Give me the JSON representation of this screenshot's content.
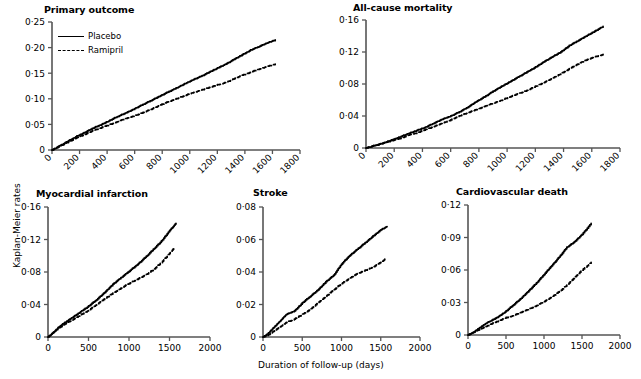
{
  "figure": {
    "y_axis_label": "Kaplan-Meier rates",
    "x_axis_label": "Duration of follow-up (days)",
    "legend": {
      "placebo_label": "Placebo",
      "ramipril_label": "Ramipril"
    },
    "colors": {
      "line": "#000000",
      "axis": "#555555",
      "background": "#ffffff"
    }
  },
  "chart_data": [
    {
      "type": "line",
      "title": "Primary outcome",
      "xlabel": "",
      "ylabel": "Kaplan-Meier rates",
      "xlim": [
        0,
        1800
      ],
      "ylim": [
        0,
        0.25
      ],
      "xticks": [
        "0",
        "200",
        "400",
        "600",
        "800",
        "1000",
        "1200",
        "1400",
        "1600",
        "1800"
      ],
      "yticks": [
        "0",
        "0·05",
        "0·10",
        "0·15",
        "0·20",
        "0·25"
      ],
      "ytick_values": [
        0,
        0.05,
        0.1,
        0.15,
        0.2,
        0.25
      ],
      "grid": false,
      "legend_position": "top-left",
      "series": [
        {
          "name": "Placebo",
          "style": "solid",
          "x": [
            0,
            60,
            120,
            180,
            240,
            300,
            360,
            420,
            480,
            540,
            600,
            660,
            720,
            780,
            840,
            900,
            960,
            1020,
            1080,
            1140,
            1200,
            1260,
            1320,
            1380,
            1440,
            1500,
            1560,
            1620
          ],
          "values": [
            0,
            0.009,
            0.018,
            0.027,
            0.035,
            0.043,
            0.05,
            0.058,
            0.066,
            0.073,
            0.081,
            0.089,
            0.097,
            0.105,
            0.113,
            0.121,
            0.129,
            0.137,
            0.144,
            0.152,
            0.16,
            0.168,
            0.177,
            0.186,
            0.195,
            0.202,
            0.209,
            0.215
          ]
        },
        {
          "name": "Ramipril",
          "style": "dashed",
          "x": [
            0,
            60,
            120,
            180,
            240,
            300,
            360,
            420,
            480,
            540,
            600,
            660,
            720,
            780,
            840,
            900,
            960,
            1020,
            1080,
            1140,
            1200,
            1260,
            1320,
            1380,
            1440,
            1500,
            1560,
            1620
          ],
          "values": [
            0,
            0.008,
            0.016,
            0.024,
            0.031,
            0.038,
            0.044,
            0.05,
            0.056,
            0.062,
            0.067,
            0.073,
            0.08,
            0.087,
            0.094,
            0.1,
            0.106,
            0.112,
            0.117,
            0.122,
            0.127,
            0.132,
            0.139,
            0.146,
            0.152,
            0.158,
            0.163,
            0.168
          ]
        }
      ]
    },
    {
      "type": "line",
      "title": "All-cause mortality",
      "xlabel": "",
      "ylabel": "",
      "xlim": [
        0,
        1800
      ],
      "ylim": [
        0,
        0.16
      ],
      "xticks": [
        "0",
        "200",
        "400",
        "600",
        "800",
        "1000",
        "1200",
        "1400",
        "1600",
        "1800"
      ],
      "yticks": [
        "0",
        "0·04",
        "0·08",
        "0·12",
        "0·16"
      ],
      "ytick_values": [
        0,
        0.04,
        0.08,
        0.12,
        0.16
      ],
      "grid": false,
      "legend_position": "none",
      "series": [
        {
          "name": "Placebo",
          "style": "solid",
          "x": [
            0,
            60,
            120,
            180,
            240,
            300,
            360,
            420,
            480,
            540,
            600,
            660,
            720,
            780,
            840,
            900,
            960,
            1020,
            1080,
            1140,
            1200,
            1260,
            1320,
            1380,
            1440,
            1500,
            1560,
            1620,
            1680
          ],
          "values": [
            0,
            0.003,
            0.006,
            0.01,
            0.014,
            0.018,
            0.022,
            0.026,
            0.031,
            0.036,
            0.04,
            0.045,
            0.051,
            0.058,
            0.064,
            0.071,
            0.077,
            0.083,
            0.089,
            0.095,
            0.101,
            0.108,
            0.114,
            0.12,
            0.128,
            0.134,
            0.14,
            0.146,
            0.152
          ]
        },
        {
          "name": "Ramipril",
          "style": "dashed",
          "x": [
            0,
            60,
            120,
            180,
            240,
            300,
            360,
            420,
            480,
            540,
            600,
            660,
            720,
            780,
            840,
            900,
            960,
            1020,
            1080,
            1140,
            1200,
            1260,
            1320,
            1380,
            1440,
            1500,
            1560,
            1620,
            1680
          ],
          "values": [
            0,
            0.003,
            0.006,
            0.009,
            0.012,
            0.016,
            0.019,
            0.023,
            0.027,
            0.031,
            0.035,
            0.04,
            0.044,
            0.048,
            0.052,
            0.056,
            0.06,
            0.064,
            0.068,
            0.072,
            0.077,
            0.082,
            0.087,
            0.093,
            0.099,
            0.105,
            0.11,
            0.114,
            0.117
          ]
        }
      ]
    },
    {
      "type": "line",
      "title": "Myocardial infarction",
      "xlabel": "",
      "ylabel": "",
      "xlim": [
        0,
        2000
      ],
      "ylim": [
        0,
        0.16
      ],
      "xticks": [
        "0",
        "500",
        "1000",
        "1500",
        "2000"
      ],
      "yticks": [
        "0",
        "0·04",
        "0·08",
        "0·12",
        "0·16"
      ],
      "ytick_values": [
        0,
        0.04,
        0.08,
        0.12,
        0.16
      ],
      "grid": false,
      "legend_position": "none",
      "series": [
        {
          "name": "Placebo",
          "style": "solid",
          "x": [
            0,
            60,
            120,
            180,
            240,
            300,
            400,
            500,
            600,
            700,
            800,
            900,
            1000,
            1100,
            1200,
            1300,
            1400,
            1500,
            1580
          ],
          "values": [
            0,
            0.005,
            0.011,
            0.016,
            0.02,
            0.024,
            0.031,
            0.038,
            0.046,
            0.055,
            0.065,
            0.073,
            0.081,
            0.089,
            0.098,
            0.108,
            0.118,
            0.131,
            0.14
          ]
        },
        {
          "name": "Ramipril",
          "style": "dashed",
          "x": [
            0,
            60,
            120,
            180,
            240,
            300,
            400,
            500,
            600,
            700,
            800,
            900,
            1000,
            1100,
            1200,
            1300,
            1400,
            1500,
            1560
          ],
          "values": [
            0,
            0.005,
            0.01,
            0.014,
            0.018,
            0.021,
            0.027,
            0.033,
            0.04,
            0.047,
            0.054,
            0.06,
            0.066,
            0.071,
            0.076,
            0.083,
            0.092,
            0.103,
            0.11
          ]
        }
      ]
    },
    {
      "type": "line",
      "title": "Stroke",
      "xlabel": "Duration of follow-up (days)",
      "ylabel": "",
      "xlim": [
        0,
        2000
      ],
      "ylim": [
        0,
        0.08
      ],
      "xticks": [
        "0",
        "500",
        "1000",
        "1500",
        "2000"
      ],
      "yticks": [
        "0",
        "0·02",
        "0·04",
        "0·06",
        "0·08"
      ],
      "ytick_values": [
        0,
        0.02,
        0.04,
        0.06,
        0.08
      ],
      "grid": false,
      "legend_position": "none",
      "series": [
        {
          "name": "Placebo",
          "style": "solid",
          "x": [
            0,
            60,
            120,
            180,
            240,
            300,
            400,
            500,
            600,
            700,
            800,
            900,
            1000,
            1100,
            1200,
            1300,
            1400,
            1500,
            1580
          ],
          "values": [
            0,
            0.002,
            0.005,
            0.008,
            0.011,
            0.014,
            0.016,
            0.021,
            0.025,
            0.029,
            0.034,
            0.038,
            0.045,
            0.05,
            0.054,
            0.058,
            0.062,
            0.066,
            0.068
          ]
        },
        {
          "name": "Ramipril",
          "style": "dashed",
          "x": [
            0,
            60,
            120,
            180,
            240,
            300,
            400,
            500,
            600,
            700,
            800,
            900,
            1000,
            1100,
            1200,
            1300,
            1400,
            1500,
            1560
          ],
          "values": [
            0,
            0.001,
            0.003,
            0.005,
            0.007,
            0.009,
            0.011,
            0.014,
            0.017,
            0.021,
            0.025,
            0.029,
            0.033,
            0.036,
            0.039,
            0.041,
            0.043,
            0.046,
            0.048
          ]
        }
      ]
    },
    {
      "type": "line",
      "title": "Cardiovascular death",
      "xlabel": "",
      "ylabel": "",
      "xlim": [
        0,
        2000
      ],
      "ylim": [
        0,
        0.12
      ],
      "xticks": [
        "0",
        "500",
        "1000",
        "1500",
        "2000"
      ],
      "yticks": [
        "0",
        "0·03",
        "0·06",
        "0·09",
        "0·12"
      ],
      "ytick_values": [
        0,
        0.03,
        0.06,
        0.09,
        0.12
      ],
      "grid": false,
      "legend_position": "none",
      "series": [
        {
          "name": "Placebo",
          "style": "solid",
          "x": [
            0,
            60,
            120,
            180,
            240,
            300,
            400,
            500,
            600,
            700,
            800,
            900,
            1000,
            1100,
            1200,
            1300,
            1400,
            1500,
            1620
          ],
          "values": [
            0,
            0.002,
            0.005,
            0.008,
            0.011,
            0.013,
            0.017,
            0.022,
            0.028,
            0.034,
            0.041,
            0.048,
            0.056,
            0.064,
            0.072,
            0.081,
            0.086,
            0.093,
            0.103
          ]
        },
        {
          "name": "Ramipril",
          "style": "dashed",
          "x": [
            0,
            60,
            120,
            180,
            240,
            300,
            400,
            500,
            600,
            700,
            800,
            900,
            1000,
            1100,
            1200,
            1300,
            1400,
            1500,
            1620
          ],
          "values": [
            0,
            0.002,
            0.004,
            0.006,
            0.008,
            0.01,
            0.013,
            0.016,
            0.018,
            0.021,
            0.024,
            0.027,
            0.031,
            0.035,
            0.04,
            0.046,
            0.053,
            0.06,
            0.067
          ]
        }
      ]
    }
  ]
}
